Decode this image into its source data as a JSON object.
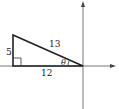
{
  "diagram": {
    "type": "right-triangle-on-axes",
    "labels": {
      "hypotenuse": "13",
      "vertical_leg": "5",
      "horizontal_leg": "12",
      "angle": "θ"
    },
    "colors": {
      "stroke": "#222222",
      "axis": "#555555",
      "background": "#ffffff"
    }
  }
}
